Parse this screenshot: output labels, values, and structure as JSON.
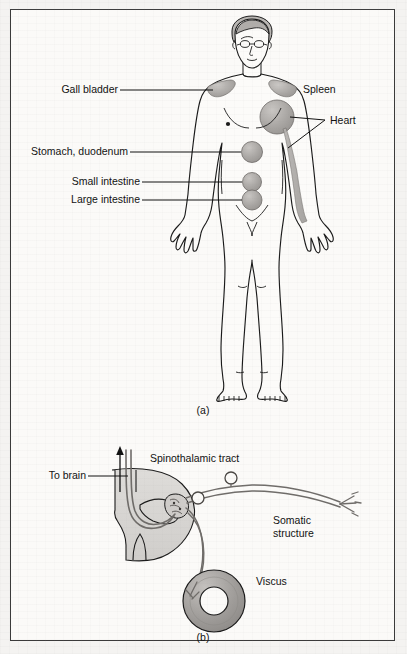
{
  "figure": {
    "panels": [
      {
        "id": "panel-a",
        "caption": "(a)",
        "title": "Referred pain body map",
        "labels": [
          {
            "key": "gall_bladder",
            "text": "Gall bladder"
          },
          {
            "key": "spleen",
            "text": "Spleen"
          },
          {
            "key": "heart",
            "text": "Heart"
          },
          {
            "key": "stomach_duodenum",
            "text": "Stomach, duodenum"
          },
          {
            "key": "small_intestine",
            "text": "Small intestine"
          },
          {
            "key": "large_intestine",
            "text": "Large intestine"
          }
        ]
      },
      {
        "id": "panel-b",
        "caption": "(b)",
        "title": "Convergence of visceral and somatic afferents",
        "labels": [
          {
            "key": "to_brain",
            "text": "To brain"
          },
          {
            "key": "spinothalamic_tract",
            "text": "Spinothalamic tract"
          },
          {
            "key": "somatic_structure",
            "text": "Somatic\nstructure"
          },
          {
            "key": "somatic_structure_l1",
            "text": "Somatic"
          },
          {
            "key": "somatic_structure_l2",
            "text": "structure"
          },
          {
            "key": "viscus",
            "text": "Viscus"
          }
        ]
      }
    ]
  },
  "colors": {
    "page_background": "#f3f2f0",
    "frame_background": "#fbfaf8",
    "frame_border": "#3a3a3a",
    "ink": "#111111",
    "outline": "#1a1a1a",
    "body_fill": "#fcfbf9",
    "organ_shade": "#a8a5a2",
    "organ_shade_light": "#bdbab7",
    "cord_fill": "#d8d6d3",
    "nerve_stroke": "#6f6c69",
    "viscus_fill": "#a09d9a"
  }
}
